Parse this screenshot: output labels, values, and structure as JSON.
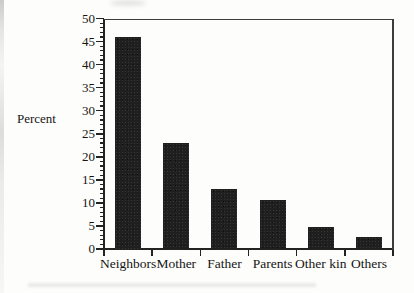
{
  "chart_data": {
    "type": "bar",
    "categories": [
      "Neighbors",
      "Mother",
      "Father",
      "Parents",
      "Other kin",
      "Others"
    ],
    "values": [
      46,
      23,
      13,
      10.6,
      4.8,
      2.5
    ],
    "title": "",
    "xlabel": "",
    "ylabel": "Percent",
    "ylim": [
      0,
      50
    ],
    "ytick_step": 5,
    "yticks": [
      0,
      5,
      10,
      15,
      20,
      25,
      30,
      35,
      40,
      45,
      50
    ],
    "minor_tick_step": 1,
    "grid": false,
    "legend": null,
    "bar_color": "#1f1f1f",
    "axis_color": "#232323",
    "background": "#fdfdfb"
  }
}
